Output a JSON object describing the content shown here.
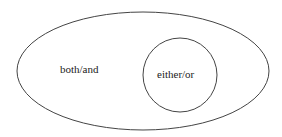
{
  "diagram": {
    "type": "nested-set",
    "outer": {
      "shape": "ellipse",
      "label": "both/and",
      "stroke": "#444444"
    },
    "inner": {
      "shape": "circle",
      "label": "either/or",
      "stroke": "#444444"
    }
  }
}
